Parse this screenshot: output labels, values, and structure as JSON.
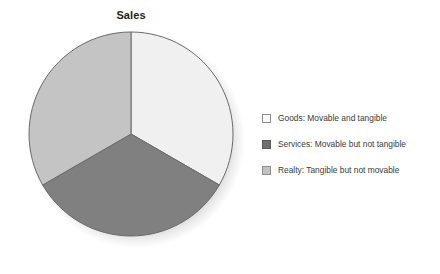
{
  "chart_data": {
    "type": "pie",
    "title": "Sales",
    "subtitle": "",
    "xlabel": "",
    "ylabel": "",
    "grid": false,
    "legend_position": "right",
    "start_angle_deg": 0,
    "direction": "clockwise",
    "categories": [
      "Goods: Movable and tangible",
      "Services: Movable but not tangible",
      "Realty: Tangible but not movable"
    ],
    "short_names": [
      "Goods",
      "Services",
      "Realty"
    ],
    "values": [
      33.3,
      33.3,
      33.3
    ],
    "percentages": [
      "33.3%",
      "33.3%",
      "33.3%"
    ],
    "slice_colors": [
      "#f0f0f0",
      "#808080",
      "#c4c4c4"
    ],
    "slice_stroke": "#6a6a6a",
    "annotations": []
  },
  "chart": {
    "title": "Sales",
    "title_color": "#231f20",
    "background": "#ffffff",
    "pie": {
      "center_x": 111,
      "center_y": 112,
      "radius": 102,
      "shadow_color": "rgba(0,0,0,0.18)",
      "slices": [
        {
          "name": "Goods",
          "label": "Goods: Movable and tangible",
          "value": 33.3,
          "color": "#f0f0f0",
          "start_deg": 0,
          "end_deg": 120
        },
        {
          "name": "Services",
          "label": "Services: Movable but not tangible",
          "value": 33.3,
          "color": "#808080",
          "start_deg": 120,
          "end_deg": 240
        },
        {
          "name": "Realty",
          "label": "Realty: Tangible but not movable",
          "value": 33.3,
          "color": "#c4c4c4",
          "start_deg": 240,
          "end_deg": 360
        }
      ]
    },
    "legend": {
      "items": [
        {
          "label": "Goods: Movable and tangible",
          "swatch_color": "#fbfbfb",
          "swatch_border": "#8d8d8d",
          "swatch_name": "legend-swatch-goods"
        },
        {
          "label": "Services: Movable but not tangible",
          "swatch_color": "#6f6f6f",
          "swatch_border": "#5a5a5a",
          "swatch_name": "legend-swatch-services"
        },
        {
          "label": "Realty: Tangible but not movable",
          "swatch_color": "#c2c2c2",
          "swatch_border": "#8d8d8d",
          "swatch_name": "legend-swatch-realty"
        }
      ]
    }
  }
}
